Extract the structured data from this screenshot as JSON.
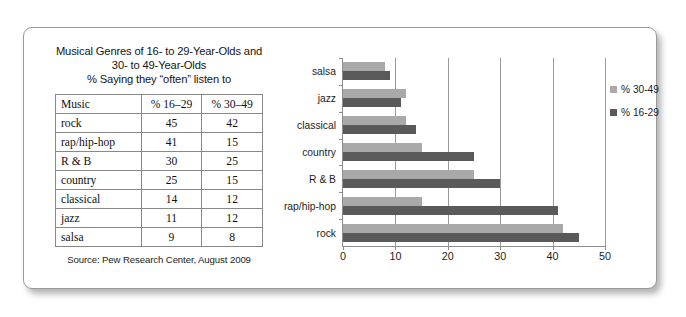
{
  "figure": {
    "title_lines": [
      "Musical Genres of 16- to 29-Year-Olds and",
      "30- to 49-Year-Olds",
      "% Saying they “often” listen to"
    ],
    "source": "Source: Pew Research Center, August 2009"
  },
  "table": {
    "headers": [
      "Music",
      "% 16–29",
      "% 30–49"
    ],
    "rows": [
      {
        "genre": "rock",
        "p16_29": "45",
        "p30_49": "42"
      },
      {
        "genre": "rap/hip-hop",
        "p16_29": "41",
        "p30_49": "15"
      },
      {
        "genre": "R & B",
        "p16_29": "30",
        "p30_49": "25"
      },
      {
        "genre": "country",
        "p16_29": "25",
        "p30_49": "15"
      },
      {
        "genre": "classical",
        "p16_29": "14",
        "p30_49": "12"
      },
      {
        "genre": "jazz",
        "p16_29": "11",
        "p30_49": "12"
      },
      {
        "genre": "salsa",
        "p16_29": "9",
        "p30_49": "8"
      }
    ]
  },
  "chart_data": {
    "type": "bar",
    "orientation": "horizontal",
    "title": "",
    "xlabel": "",
    "ylabel": "",
    "xlim": [
      0,
      50
    ],
    "xticks": [
      0,
      10,
      20,
      30,
      40,
      50
    ],
    "grid": true,
    "legend_position": "right",
    "categories": [
      "salsa",
      "jazz",
      "classical",
      "country",
      "R & B",
      "rap/hip-hop",
      "rock"
    ],
    "series": [
      {
        "name": "% 30-49",
        "color": "#a9a9a9",
        "values": [
          8,
          12,
          12,
          15,
          25,
          15,
          42
        ]
      },
      {
        "name": "% 16-29",
        "color": "#5a5a5a",
        "values": [
          9,
          11,
          14,
          25,
          30,
          41,
          45
        ]
      }
    ]
  },
  "legend": {
    "items": [
      {
        "label": "% 30-49",
        "swatch": "light"
      },
      {
        "label": "% 16-29",
        "swatch": "dark"
      }
    ]
  }
}
